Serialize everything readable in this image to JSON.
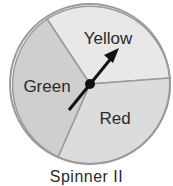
{
  "diagram": {
    "title": "Spinner II",
    "sections": [
      {
        "label": "Yellow",
        "fill": "#e8e8e8"
      },
      {
        "label": "Green",
        "fill": "#cfcfcf"
      },
      {
        "label": "Red",
        "fill": "#dcdcdc"
      }
    ],
    "border_color": "#9a9a9a",
    "arrow_color": "#111111"
  }
}
